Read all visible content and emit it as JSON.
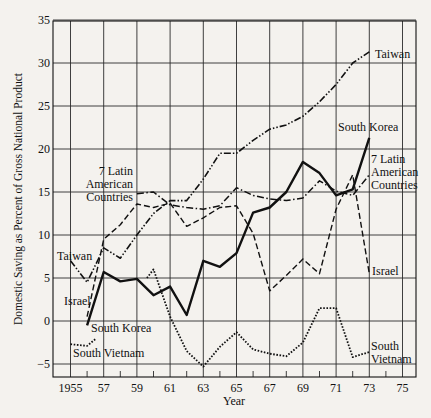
{
  "chart_data": {
    "type": "line",
    "title": "",
    "xlabel": "Year",
    "ylabel": "Domestic Saving as Percent of Gross National Product",
    "xlim": [
      1953.9,
      1976
    ],
    "ylim": [
      -6.5,
      35
    ],
    "grid": true,
    "x_ticks": [
      1955,
      1957,
      1959,
      1961,
      1963,
      1965,
      1967,
      1969,
      1971,
      1973,
      1975
    ],
    "x_tick_labels": [
      "1955",
      "57",
      "59",
      "61",
      "63",
      "65",
      "67",
      "69",
      "71",
      "73",
      "75"
    ],
    "y_ticks": [
      -5,
      0,
      5,
      10,
      15,
      20,
      25,
      30,
      35
    ],
    "y_tick_labels": [
      "−5",
      "0",
      "5",
      "10",
      "15",
      "20",
      "25",
      "30",
      "35"
    ],
    "series": [
      {
        "name": "Taiwan",
        "style": "dash-dot-dot",
        "segments": [
          [
            [
              1955,
              7.0
            ],
            [
              1956,
              4.5
            ],
            [
              1957,
              8.5
            ],
            [
              1958,
              7.3
            ],
            [
              1959,
              10.0
            ],
            [
              1960,
              12.5
            ],
            [
              1961,
              14.0
            ],
            [
              1962,
              14.0
            ],
            [
              1963,
              16.5
            ],
            [
              1964,
              19.5
            ],
            [
              1965,
              19.5
            ],
            [
              1966,
              21.0
            ],
            [
              1967,
              22.3
            ],
            [
              1968,
              22.8
            ],
            [
              1969,
              23.8
            ],
            [
              1970,
              25.5
            ],
            [
              1971,
              27.5
            ],
            [
              1972,
              30.0
            ],
            [
              1973,
              31.3
            ]
          ]
        ]
      },
      {
        "name": "South Korea",
        "style": "solid-bold",
        "segments": [
          [
            [
              1956,
              -0.5
            ],
            [
              1957,
              5.7
            ],
            [
              1958,
              4.6
            ],
            [
              1959,
              4.9
            ],
            [
              1960,
              3.0
            ],
            [
              1961,
              4.0
            ],
            [
              1962,
              0.7
            ],
            [
              1963,
              7.0
            ],
            [
              1964,
              6.3
            ],
            [
              1965,
              7.9
            ],
            [
              1966,
              12.6
            ],
            [
              1967,
              13.2
            ],
            [
              1968,
              15.0
            ],
            [
              1969,
              18.5
            ],
            [
              1970,
              17.2
            ],
            [
              1971,
              14.6
            ],
            [
              1972,
              15.3
            ],
            [
              1973,
              21.3
            ]
          ]
        ]
      },
      {
        "name": "Israel",
        "style": "dashed",
        "segments": [
          [
            [
              1956,
              0.5
            ],
            [
              1957,
              9.5
            ],
            [
              1958,
              11.2
            ],
            [
              1959,
              13.6
            ],
            [
              1960,
              13.2
            ],
            [
              1961,
              13.7
            ],
            [
              1962,
              11.0
            ],
            [
              1963,
              12.0
            ],
            [
              1964,
              13.2
            ],
            [
              1965,
              13.4
            ],
            [
              1966,
              10.2
            ],
            [
              1967,
              3.5
            ],
            [
              1968,
              5.3
            ],
            [
              1969,
              7.2
            ],
            [
              1970,
              5.5
            ],
            [
              1971,
              13.0
            ],
            [
              1972,
              17.0
            ],
            [
              1973,
              5.5
            ]
          ]
        ]
      },
      {
        "name": "7 Latin American Countries",
        "style": "dash-dot",
        "segments": [
          [
            [
              1959,
              14.8
            ],
            [
              1960,
              15.0
            ],
            [
              1961,
              13.5
            ],
            [
              1962,
              13.2
            ],
            [
              1963,
              13.0
            ],
            [
              1964,
              13.4
            ],
            [
              1965,
              15.5
            ],
            [
              1966,
              14.6
            ],
            [
              1967,
              14.2
            ],
            [
              1968,
              14.0
            ],
            [
              1969,
              14.3
            ],
            [
              1970,
              16.3
            ],
            [
              1971,
              15.1
            ],
            [
              1972,
              14.6
            ],
            [
              1973,
              17.0
            ]
          ]
        ]
      },
      {
        "name": "South Vietnam",
        "style": "dotted",
        "segments": [
          [
            [
              1955,
              -2.7
            ],
            [
              1956,
              -2.9
            ],
            [
              1956.5,
              -2.1
            ]
          ],
          [
            [
              1959.6,
              5.0
            ],
            [
              1960,
              6.0
            ],
            [
              1961,
              0.5
            ],
            [
              1962,
              -3.5
            ],
            [
              1963,
              -5.3
            ],
            [
              1964,
              -3.0
            ],
            [
              1965,
              -1.3
            ],
            [
              1966,
              -3.3
            ],
            [
              1967,
              -3.8
            ],
            [
              1968,
              -4.1
            ],
            [
              1969,
              -2.5
            ],
            [
              1970,
              1.5
            ],
            [
              1971,
              1.5
            ],
            [
              1972,
              -4.2
            ],
            [
              1973,
              -3.6
            ]
          ]
        ]
      }
    ],
    "annotations": [
      {
        "text": "Taiwan",
        "lines": [
          "Taiwan"
        ],
        "x": 375,
        "y": 58,
        "anchor": "start"
      },
      {
        "text": "South Korea",
        "lines": [
          "South Korea"
        ],
        "x": 338,
        "y": 131,
        "anchor": "start"
      },
      {
        "text": "7 Latin American Countries (right)",
        "lines": [
          "7 Latin",
          "American",
          "Countries"
        ],
        "x": 371,
        "y": 163,
        "anchor": "start"
      },
      {
        "text": "Israel (right)",
        "lines": [
          "Israel"
        ],
        "x": 372,
        "y": 275,
        "anchor": "start"
      },
      {
        "text": "South Vietnam (right)",
        "lines": [
          "South",
          "Vietnam"
        ],
        "x": 371,
        "y": 350,
        "anchor": "start"
      },
      {
        "text": "7 Latin American Countries (left)",
        "lines": [
          "7 Latin",
          "American",
          "Countries"
        ],
        "x": 133,
        "y": 175,
        "anchor": "end"
      },
      {
        "text": "Taiwan (left)",
        "lines": [
          "Taiwan"
        ],
        "x": 57,
        "y": 260,
        "anchor": "start"
      },
      {
        "text": "Israel (left)",
        "lines": [
          "Israel"
        ],
        "x": 64,
        "y": 305,
        "anchor": "start"
      },
      {
        "text": "South Korea (left)",
        "lines": [
          "South Korea"
        ],
        "x": 91,
        "y": 332,
        "anchor": "start"
      },
      {
        "text": "South Vietnam (left)",
        "lines": [
          "South Vietnam"
        ],
        "x": 73,
        "y": 357,
        "anchor": "start"
      }
    ]
  },
  "layout": {
    "plot": {
      "left": 53,
      "top": 21,
      "right": 416,
      "bottom": 377
    },
    "x_origin_year": 1955,
    "x_origin_px": 70.5,
    "px_per_year": 16.6,
    "y_zero_px": 321,
    "px_per_unit": 8.6,
    "line_color": "#111111",
    "grid_color": "#2a2a2a",
    "background": "#f4f2ee"
  }
}
